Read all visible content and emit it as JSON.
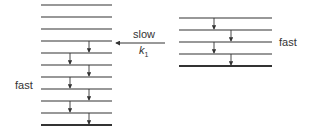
{
  "labels": {
    "slow": "slow",
    "k": "k",
    "k_sub": "1",
    "fast_left": "fast",
    "fast_right": "fast"
  },
  "left_ladder": {
    "x1": 41,
    "x2": 112,
    "levels_y": [
      5,
      17,
      29,
      41,
      53,
      65,
      77,
      89,
      101,
      113,
      125
    ],
    "arrows": [
      {
        "x": 89,
        "from": 41,
        "to": 53
      },
      {
        "x": 70,
        "from": 53,
        "to": 65
      },
      {
        "x": 89,
        "from": 65,
        "to": 77
      },
      {
        "x": 70,
        "from": 77,
        "to": 89
      },
      {
        "x": 89,
        "from": 89,
        "to": 101
      },
      {
        "x": 70,
        "from": 101,
        "to": 113
      },
      {
        "x": 89,
        "from": 113,
        "to": 125
      }
    ]
  },
  "right_ladder": {
    "x1": 179,
    "x2": 272,
    "levels_y": [
      18,
      30,
      42,
      54,
      66
    ],
    "arrows": [
      {
        "x": 214,
        "from": 18,
        "to": 30
      },
      {
        "x": 231,
        "from": 30,
        "to": 42
      },
      {
        "x": 214,
        "from": 42,
        "to": 54
      },
      {
        "x": 231,
        "from": 54,
        "to": 66
      }
    ]
  },
  "transfer_arrow": {
    "from_x": 165,
    "to_x": 114,
    "y": 43
  },
  "colors": {
    "line": "#333333"
  }
}
